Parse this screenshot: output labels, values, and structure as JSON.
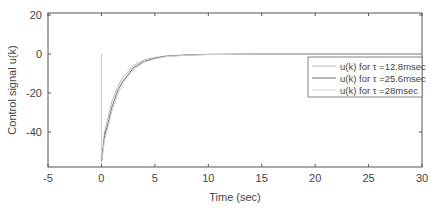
{
  "chart_data": {
    "type": "line",
    "title": "",
    "xlabel": "Time (sec)",
    "ylabel": "Control signal u(k)",
    "xlim": [
      -5,
      30
    ],
    "ylim": [
      -58,
      21
    ],
    "xticks": [
      -5,
      0,
      5,
      10,
      15,
      20,
      25,
      30
    ],
    "yticks": [
      20,
      0,
      -20,
      -40
    ],
    "grid": false,
    "legend_position": "right-middle",
    "series": [
      {
        "name": "u(k) for τ =12.8msec",
        "color": "#b8b8b8",
        "x": [
          0,
          0.1,
          0.3,
          0.6,
          1,
          1.5,
          2,
          3,
          4,
          5,
          6,
          8,
          10,
          15,
          30
        ],
        "y": [
          -56,
          -50,
          -40,
          -33,
          -24,
          -17,
          -12,
          -6,
          -3,
          -1.8,
          -1,
          -0.4,
          -0.2,
          0,
          0
        ]
      },
      {
        "name": "u(k) for τ =25.6msec",
        "color": "#707070",
        "x": [
          0,
          0.1,
          0.3,
          0.6,
          1,
          1.5,
          2,
          3,
          4,
          5,
          6,
          8,
          10,
          15,
          30
        ],
        "y": [
          -56,
          -51,
          -42,
          -36,
          -27,
          -19,
          -14,
          -7,
          -3.8,
          -2.2,
          -1.2,
          -0.5,
          -0.2,
          0,
          0
        ]
      },
      {
        "name": "u(k) for τ =28msec",
        "color": "#d0d0d0",
        "x": [
          0,
          0.1,
          0.3,
          0.6,
          1,
          1.5,
          2,
          3,
          4,
          5,
          6,
          8,
          10,
          15,
          30
        ],
        "y": [
          -56,
          -52,
          -44,
          -38,
          -29,
          -21,
          -15,
          -8,
          -4.2,
          -2.5,
          -1.4,
          -0.6,
          -0.3,
          0,
          0
        ]
      }
    ],
    "annotations": [
      {
        "type": "vertical-line",
        "x": 0,
        "y_from": -56,
        "y_to": 0,
        "color": "#c8c8c8"
      }
    ]
  }
}
